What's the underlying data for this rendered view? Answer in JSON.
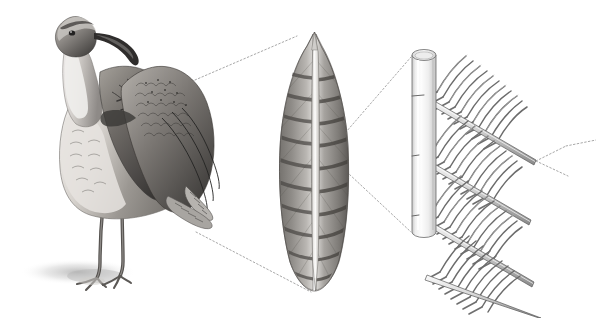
{
  "figure": {
    "title": "Feather structure magnification series",
    "background_color": "#ffffff",
    "width": 596,
    "height": 318,
    "style": "grayscale pencil / graphite scientific illustration",
    "panels": [
      {
        "id": "bird",
        "label": "Whole bird",
        "subject": "wading bird (curlew / whimbrel) standing, preening, with long down-curved bill and raised wing",
        "description": "Full-body graphite drawing of a shorebird standing on two legs with a soft cast shadow at its feet; the folded wing is lifted to show barred covert and flight feathers.",
        "bbox": [
          10,
          5,
          235,
          300
        ],
        "tones": {
          "darkest": "#2b2b2b",
          "mid": "#808080",
          "light": "#d8d8d8",
          "shadow": "#cfcfcf"
        }
      },
      {
        "id": "feather",
        "label": "Single flight feather",
        "subject": "one barred contour / flight feather seen flat, pointed at the top, rounded at the base",
        "description": "Magnified single feather with a pale central rachis and dark transverse barring across both vanes.",
        "bbox": [
          275,
          30,
          75,
          265
        ],
        "tones": {
          "darkest": "#3a3a3a",
          "mid": "#7d7d7d",
          "light": "#e2e2e2",
          "rachis": "#f2f2f2"
        }
      },
      {
        "id": "barbs",
        "label": "Rachis and barb detail",
        "subject": "cylindrical rachis with rows of barbs bearing interlocking barbules",
        "description": "Highly magnified diagram: a pale cylinder (the rachis) on the left with four diagonal ranks of barbs extending to the lower right, each barb carrying a comb of fine parallel barbules.",
        "bbox": [
          405,
          45,
          190,
          270
        ],
        "rachis": {
          "x": 412,
          "y_top": 50,
          "y_bottom": 238,
          "width": 24,
          "fill_light": "#fafafa",
          "fill_shade": "#d0d0d0",
          "outline": "#6a6a6a"
        },
        "barb_rows": 4,
        "barbules_per_row": 22,
        "tones": {
          "line": "#5a5a5a",
          "fill": "#9a9a9a",
          "highlight": "#ffffff"
        }
      }
    ],
    "leader_lines": [
      {
        "id": "bird-to-feather-upper",
        "from": "bird wing upper edge",
        "to": "feather tip",
        "from_point": [
          188,
          83
        ],
        "to_point": [
          297,
          36
        ],
        "style": "dotted",
        "color": "#8a8a8a"
      },
      {
        "id": "bird-to-feather-lower",
        "from": "bird wing lower tip",
        "to": "feather base",
        "from_point": [
          196,
          232
        ],
        "to_point": [
          310,
          292
        ],
        "style": "dotted",
        "color": "#8a8a8a"
      },
      {
        "id": "feather-to-rachis-upper",
        "from": "feather mid-vane",
        "to": "rachis cylinder top",
        "from_point": [
          333,
          147
        ],
        "to_point": [
          411,
          57
        ],
        "style": "dotted",
        "color": "#8a8a8a"
      },
      {
        "id": "feather-to-rachis-lower",
        "from": "feather mid-vane",
        "to": "rachis cylinder bottom",
        "from_point": [
          333,
          159
        ],
        "to_point": [
          411,
          232
        ],
        "style": "dotted",
        "color": "#8a8a8a"
      },
      {
        "id": "barbs-to-offscreen",
        "from": "barbule tip cluster",
        "to": "off right edge",
        "from_point": [
          536,
          160
        ],
        "to_point": [
          596,
          140
        ],
        "style": "dotted",
        "color": "#8a8a8a"
      }
    ]
  }
}
